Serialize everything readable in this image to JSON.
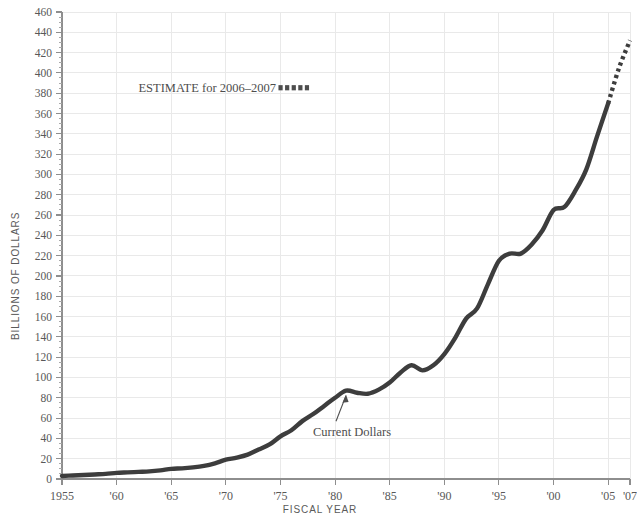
{
  "chart_data": {
    "type": "line",
    "title": "",
    "subtitle": "",
    "xlabel": "FISCAL YEAR",
    "ylabel": "BILLIONS OF DOLLARS",
    "xlim": [
      1955,
      2007
    ],
    "ylim": [
      0,
      460
    ],
    "y_tick_step": 20,
    "y_minor_step": 5,
    "grid": true,
    "grid_axis": "both",
    "legend_position": "upper-left-inside",
    "x_tick_labels": [
      "1955",
      "'60",
      "'65",
      "'70",
      "'75",
      "'80",
      "'85",
      "'90",
      "'95",
      "'00",
      "'05",
      "'07"
    ],
    "x_tick_values": [
      1955,
      1960,
      1965,
      1970,
      1975,
      1980,
      1985,
      1990,
      1995,
      2000,
      2005,
      2007
    ],
    "y_tick_labels": [
      "0",
      "20",
      "40",
      "60",
      "80",
      "100",
      "120",
      "140",
      "160",
      "180",
      "200",
      "220",
      "240",
      "260",
      "280",
      "300",
      "320",
      "340",
      "360",
      "380",
      "400",
      "420",
      "440",
      "460"
    ],
    "y_tick_values": [
      0,
      20,
      40,
      60,
      80,
      100,
      120,
      140,
      160,
      180,
      200,
      220,
      240,
      260,
      280,
      300,
      320,
      340,
      360,
      380,
      400,
      420,
      440,
      460
    ],
    "series": [
      {
        "name": "Current Dollars",
        "style": "solid",
        "color": "#3d3d3d",
        "x": [
          1955,
          1956,
          1957,
          1958,
          1959,
          1960,
          1961,
          1962,
          1963,
          1964,
          1965,
          1966,
          1967,
          1968,
          1969,
          1970,
          1971,
          1972,
          1973,
          1974,
          1975,
          1976,
          1977,
          1978,
          1979,
          1980,
          1981,
          1982,
          1983,
          1984,
          1985,
          1986,
          1987,
          1988,
          1989,
          1990,
          1991,
          1992,
          1993,
          1994,
          1995,
          1996,
          1997,
          1998,
          1999,
          2000,
          2001,
          2002,
          2003,
          2004,
          2005
        ],
        "y": [
          3,
          3.5,
          4,
          4.5,
          5,
          6,
          6.5,
          7,
          7.5,
          8.5,
          10,
          10.5,
          11.5,
          13,
          15.5,
          19,
          21,
          24,
          29,
          34,
          42,
          48,
          57,
          64,
          72,
          80,
          87,
          85,
          84,
          88,
          95,
          105,
          112,
          107,
          112,
          123,
          139,
          158,
          168,
          192,
          215,
          222,
          222,
          231,
          245,
          265,
          268,
          284,
          305,
          338,
          370
        ],
        "note": "Solid observed series, Federal spending in current dollars"
      },
      {
        "name": "ESTIMATE for 2006-2007",
        "style": "dotted",
        "color": "#3d3d3d",
        "x": [
          2005,
          2006,
          2007
        ],
        "y": [
          370,
          405,
          432
        ],
        "note": "Dotted estimate segment at upper right"
      }
    ],
    "annotations": [
      {
        "name": "current-dollars-annotation",
        "text": "Current Dollars",
        "label_x": 1981,
        "label_y": 45,
        "target_x": 1981,
        "target_y": 88,
        "arrow": true
      },
      {
        "name": "estimate-legend",
        "text": "ESTIMATE for 2006–2007",
        "label_x": 1962,
        "label_y": 385,
        "swatch": "dotted-squares",
        "swatch_count": 5
      }
    ],
    "colors": {
      "line": "#3d3d3d",
      "grid": "#e9e9e9",
      "axis": "#8e8e8e",
      "text": "#585858",
      "background": "#ffffff"
    }
  },
  "axes": {
    "y_title": "BILLIONS OF DOLLARS",
    "x_title": "FISCAL YEAR"
  },
  "legend": {
    "estimate_label": "ESTIMATE for 2006–2007"
  },
  "annotations": {
    "current_dollars_label": "Current Dollars"
  }
}
